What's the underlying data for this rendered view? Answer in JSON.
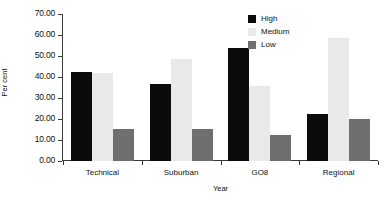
{
  "chart_data": {
    "type": "bar",
    "title": "",
    "subtitle": "",
    "xlabel": "Year",
    "ylabel": "Per cent",
    "categories": [
      "Technical",
      "Suburban",
      "GO8",
      "Regional"
    ],
    "series": [
      {
        "name": "High",
        "color": "#0b0b0b",
        "values": [
          42.3,
          36.8,
          54.0,
          22.3
        ]
      },
      {
        "name": "Medium",
        "color": "#e9e9e9",
        "values": [
          42.0,
          48.6,
          35.6,
          58.5
        ]
      },
      {
        "name": "Low",
        "color": "#6f6f6f",
        "values": [
          15.2,
          15.3,
          12.2,
          20.1
        ]
      }
    ],
    "ylim": [
      0,
      70
    ],
    "yticks": [
      "0.00",
      "10.00",
      "20.00",
      "30.00",
      "40.00",
      "50.00",
      "60.00",
      "70.00"
    ],
    "ytick_values": [
      0,
      10,
      20,
      30,
      40,
      50,
      60,
      70
    ],
    "grid": false,
    "legend_position": "top-right"
  },
  "axes": {
    "y_title": "Per cent",
    "x_title": "Year"
  },
  "legend": {
    "entries": [
      {
        "label": "High",
        "color": "#0b0b0b"
      },
      {
        "label": "Medium",
        "color": "#e9e9e9"
      },
      {
        "label": "Low",
        "color": "#6f6f6f"
      }
    ]
  }
}
